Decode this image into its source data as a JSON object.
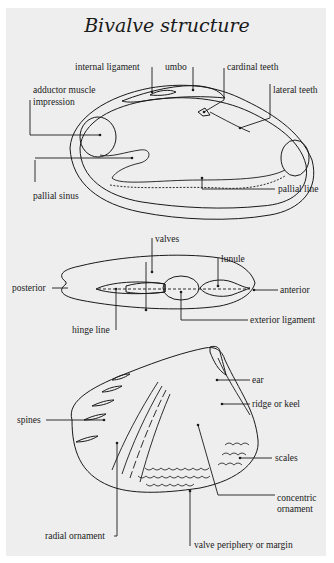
{
  "title": "Bivalve structure",
  "diagrams": {
    "interior_view": {
      "labels": {
        "internal_ligament": "internal ligament",
        "umbo": "umbo",
        "cardinal_teeth": "cardinal teeth",
        "lateral_teeth": "lateral teeth",
        "adductor_line1": "adductor muscle",
        "adductor_line2": "impression",
        "pallial_sinus": "pallial sinus",
        "pallial_line": "pallial line"
      }
    },
    "dorsal_view": {
      "labels": {
        "valves": "valves",
        "lunule": "lunule",
        "posterior": "posterior",
        "anterior": "anterior",
        "hinge_line": "hinge line",
        "exterior_ligament": "exterior ligament"
      }
    },
    "exterior_view": {
      "labels": {
        "ear": "ear",
        "ridge_or_keel": "ridge or keel",
        "spines": "spines",
        "scales": "scales",
        "concentric_line1": "concentric",
        "concentric_line2": "ornament",
        "radial_ornament": "radial ornament",
        "valve_periphery": "valve periphery or margin"
      }
    }
  },
  "colors": {
    "background": "#eeeeee",
    "ink": "#1a1a1a"
  }
}
